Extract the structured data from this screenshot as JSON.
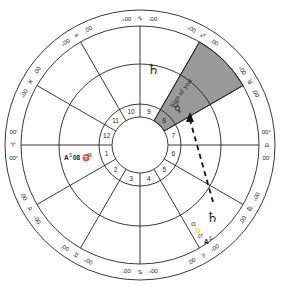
{
  "chart": {
    "signs": [
      {
        "name": "aries",
        "glyph": "♈",
        "left_deg": "00°",
        "right_deg": "00'"
      },
      {
        "name": "taurus",
        "glyph": "♉",
        "left_deg": "00°",
        "right_deg": "00'"
      },
      {
        "name": "gemini",
        "glyph": "♊",
        "left_deg": "00°",
        "right_deg": "00'"
      },
      {
        "name": "cancer",
        "glyph": "♋",
        "left_deg": "00°",
        "right_deg": "00'"
      },
      {
        "name": "leo",
        "glyph": "♌",
        "left_deg": "00°",
        "right_deg": "00'"
      },
      {
        "name": "virgo",
        "glyph": "♍",
        "left_deg": "00°",
        "right_deg": "00'"
      },
      {
        "name": "libra",
        "glyph": "♎",
        "left_deg": "00°",
        "right_deg": "00'"
      },
      {
        "name": "scorpio",
        "glyph": "♏",
        "left_deg": "00°",
        "right_deg": "00'"
      },
      {
        "name": "sagittarius",
        "glyph": "♐",
        "left_deg": "00°",
        "right_deg": "00'"
      },
      {
        "name": "capricorn",
        "glyph": "♑",
        "left_deg": "00°",
        "right_deg": "00'"
      },
      {
        "name": "aquarius",
        "glyph": "♒",
        "left_deg": "00°",
        "right_deg": "00'"
      },
      {
        "name": "pisces",
        "glyph": "♓",
        "left_deg": "00°",
        "right_deg": "00'"
      }
    ],
    "houses": [
      "1",
      "2",
      "3",
      "4",
      "5",
      "6",
      "7",
      "8",
      "9",
      "10",
      "11",
      "12"
    ],
    "highlighted_house": "8",
    "sign_of_year_label": "Sign of year",
    "planets": {
      "saturn_upper": "♄",
      "mercury": "☿",
      "saturn_lower": "♄"
    },
    "ascendant_left": {
      "prefix": "A",
      "sup": "S",
      "text": "08 ♈",
      "sup2": "46"
    },
    "ascendant_lower": {
      "line1": "01",
      "line2": "♌",
      "line3": "07",
      "prefix": "A",
      "sup": "S"
    }
  }
}
